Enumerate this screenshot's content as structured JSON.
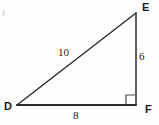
{
  "figure": {
    "kind": "right-triangle-geometry-diagram",
    "background_color": "#fdfdfd",
    "stroke_color": "#2b2b2b",
    "vertices": {
      "d": {
        "label": "D",
        "x": 17,
        "y": 105
      },
      "e": {
        "label": "E",
        "x": 136,
        "y": 13
      },
      "f": {
        "label": "F",
        "x": 136,
        "y": 105
      }
    },
    "sides": [
      {
        "name": "hypotenuse-de",
        "from": "D",
        "to": "E",
        "length_label": "10"
      },
      {
        "name": "leg-ef",
        "from": "E",
        "to": "F",
        "length_label": "6"
      },
      {
        "name": "leg-df",
        "from": "D",
        "to": "F",
        "length_label": "8"
      }
    ],
    "right_angle": {
      "at": "F",
      "marker": "square"
    }
  },
  "labels": {
    "vertex_d": "D",
    "vertex_e": "E",
    "vertex_f": "F",
    "side_de": "10",
    "side_ef": "6",
    "side_df": "8"
  }
}
